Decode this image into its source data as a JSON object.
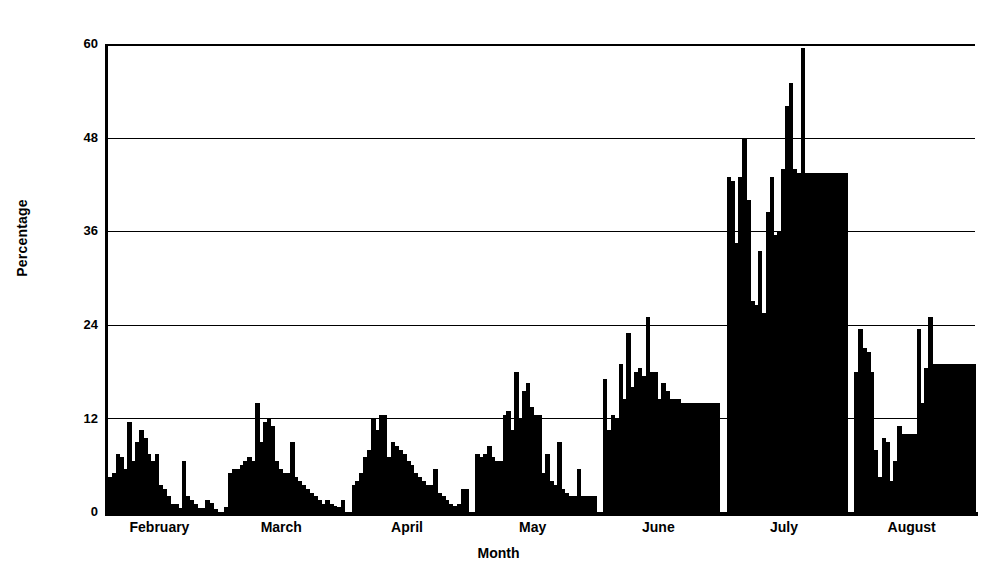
{
  "chart_data": {
    "type": "bar",
    "title": "",
    "xlabel": "Month",
    "ylabel": "Percentage",
    "ylim": [
      0,
      60
    ],
    "yticks": [
      0,
      12,
      24,
      36,
      48,
      60
    ],
    "grid": true,
    "legend": "none",
    "bar_color": "#000000",
    "background": "#ffffff",
    "categories": [
      "February",
      "March",
      "April",
      "May",
      "June",
      "July",
      "August"
    ],
    "note": "Daily values grouped by month; each bar is one day.",
    "series": [
      {
        "name": "Percentage",
        "groups": [
          {
            "category": "February",
            "values": [
              4.5,
              5.0,
              7.5,
              7.0,
              5.5,
              11.5,
              6.5,
              9.0,
              10.5,
              9.5,
              7.5,
              6.5,
              7.5,
              3.5,
              3.0,
              2.0,
              1.0,
              1.0,
              0.5,
              6.5,
              2.0,
              1.5,
              1.0,
              0.5,
              0.5,
              1.5,
              1.2,
              0.4
            ]
          },
          {
            "category": "March",
            "values": [
              0.6,
              5.0,
              5.5,
              5.5,
              6.0,
              6.5,
              7.0,
              6.5,
              14.0,
              9.0,
              11.5,
              12.0,
              11.0,
              6.5,
              5.5,
              5.0,
              5.0,
              9.0,
              4.5,
              4.0,
              3.5,
              3.0,
              2.5,
              2.0,
              1.5,
              1.0,
              1.5,
              1.0,
              0.8,
              0.6,
              1.5
            ]
          },
          {
            "category": "April",
            "values": [
              3.5,
              4.0,
              5.0,
              7.0,
              8.0,
              12.0,
              10.5,
              12.5,
              12.5,
              7.0,
              9.0,
              8.5,
              8.0,
              7.5,
              6.5,
              6.0,
              5.0,
              4.5,
              4.0,
              3.5,
              3.5,
              5.5,
              2.5,
              2.0,
              1.5,
              1.0,
              0.8,
              1.0,
              3.0,
              3.0
            ]
          },
          {
            "category": "May",
            "values": [
              7.5,
              7.0,
              7.5,
              8.5,
              7.0,
              6.5,
              6.5,
              12.5,
              13.0,
              10.5,
              18.0,
              12.0,
              15.5,
              16.5,
              13.5,
              12.5,
              12.5,
              5.0,
              7.5,
              4.0,
              3.5,
              9.0,
              3.0,
              2.5,
              2.0,
              2.0,
              5.5,
              2.0,
              2.0,
              2.0,
              2.0
            ]
          },
          {
            "category": "June",
            "values": [
              17.0,
              10.5,
              12.5,
              12.0,
              19.0,
              14.5,
              23.0,
              16.0,
              18.0,
              18.5,
              17.5,
              25.0,
              18.0,
              18.0,
              14.5,
              16.5,
              15.5,
              14.5,
              14.5,
              14.5,
              14.0,
              14.0,
              14.0,
              14.0,
              14.0,
              14.0,
              14.0,
              14.0,
              14.0,
              14.0
            ]
          },
          {
            "category": "July",
            "values": [
              43.0,
              42.5,
              34.5,
              43.0,
              48.0,
              40.0,
              27.0,
              26.5,
              33.5,
              25.5,
              38.5,
              43.0,
              35.5,
              36.0,
              44.0,
              52.0,
              55.0,
              44.0,
              43.5,
              59.5,
              43.5,
              43.5,
              43.5,
              43.5,
              43.5,
              43.5,
              43.5,
              43.5,
              43.5,
              43.5,
              43.5
            ]
          },
          {
            "category": "August",
            "values": [
              18.0,
              23.5,
              21.0,
              20.5,
              18.0,
              8.0,
              4.5,
              9.5,
              9.0,
              4.0,
              6.5,
              11.0,
              10.0,
              10.0,
              10.0,
              10.0,
              23.5,
              14.0,
              18.5,
              25.0,
              19.0,
              19.0,
              19.0,
              19.0,
              19.0,
              19.0,
              19.0,
              19.0,
              19.0,
              19.0,
              19.0
            ]
          }
        ]
      }
    ]
  },
  "axes": {
    "y_ticks": [
      "60",
      "48",
      "36",
      "24",
      "12",
      "0"
    ],
    "y_title": "Percentage",
    "x_title": "Month"
  }
}
